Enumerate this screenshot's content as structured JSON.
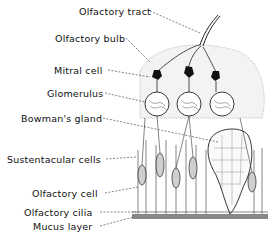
{
  "diagram": {
    "labels": [
      {
        "id": "olfactory-tract",
        "text": "Olfactory tract",
        "x": 79,
        "y": 6
      },
      {
        "id": "olfactory-bulb",
        "text": "Olfactory bulb",
        "x": 55,
        "y": 33
      },
      {
        "id": "mitral-cell",
        "text": "Mitral cell",
        "x": 54,
        "y": 65
      },
      {
        "id": "glomerulus",
        "text": "Glomerulus",
        "x": 47,
        "y": 88
      },
      {
        "id": "bowmans-gland",
        "text": "Bowman's gland",
        "x": 21,
        "y": 113
      },
      {
        "id": "sustentacular-cells",
        "text": "Sustentacular cells",
        "x": 7,
        "y": 154
      },
      {
        "id": "olfactory-cell",
        "text": "Olfactory cell",
        "x": 32,
        "y": 188
      },
      {
        "id": "olfactory-cilia",
        "text": "Olfactory cilia",
        "x": 24,
        "y": 207
      },
      {
        "id": "mucus-layer",
        "text": "Mucus layer",
        "x": 33,
        "y": 221
      }
    ]
  }
}
